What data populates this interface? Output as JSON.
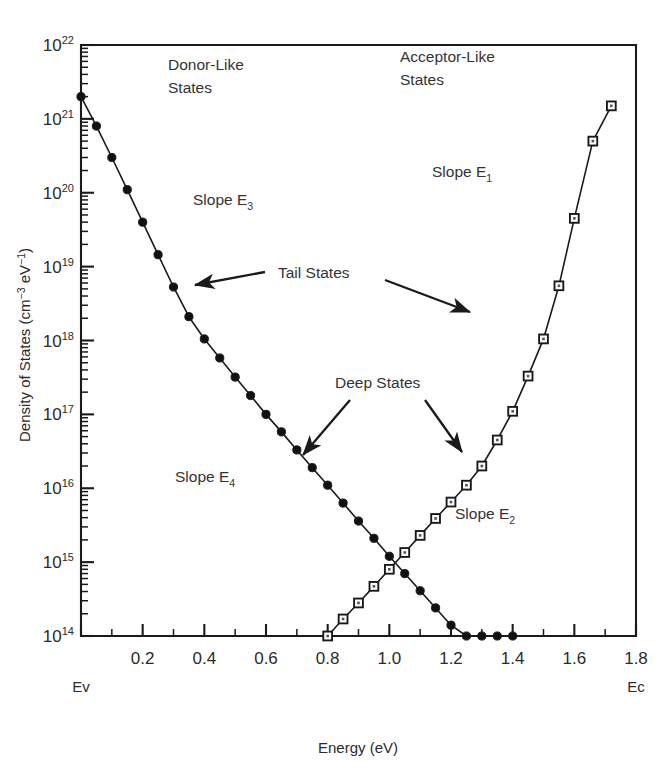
{
  "chart_data": {
    "type": "line",
    "title": "",
    "xlabel": "Energy (eV)",
    "ylabel": "Density of States (cm−3 eV−1)",
    "ylabel_parts": {
      "main": "Density of States (cm",
      "exp1": "−3",
      "mid": " eV",
      "exp2": "−1",
      "close": ")"
    },
    "xlim": [
      0.0,
      1.8
    ],
    "ylim": [
      100000000000000.0,
      1e+22
    ],
    "yscale": "log",
    "grid": false,
    "legend": "none",
    "xticks": [
      0.0,
      0.2,
      0.4,
      0.6,
      0.8,
      1.0,
      1.2,
      1.4,
      1.6,
      1.8
    ],
    "xtick_labels": [
      "",
      "0.2",
      "0.4",
      "0.6",
      "0.8",
      "1.0",
      "1.2",
      "1.4",
      "1.6",
      "1.8"
    ],
    "xminor_step": 0.1,
    "ytick_exponents": [
      14,
      15,
      16,
      17,
      18,
      19,
      20,
      21,
      22
    ],
    "ytick_labels": [
      "10^14",
      "10^15",
      "10^16",
      "10^17",
      "10^18",
      "10^19",
      "10^20",
      "10^21",
      "10^22"
    ],
    "ybase": "10",
    "axis_end_labels": {
      "left": "Ev",
      "right": "Ec"
    },
    "series": [
      {
        "name": "Donor-Like States",
        "marker": "filled-circle",
        "x": [
          0.0,
          0.05,
          0.1,
          0.15,
          0.2,
          0.25,
          0.3,
          0.35,
          0.4,
          0.45,
          0.5,
          0.55,
          0.6,
          0.65,
          0.7,
          0.75,
          0.8,
          0.85,
          0.9,
          0.95,
          1.0,
          1.05,
          1.1,
          1.15,
          1.2,
          1.25,
          1.3,
          1.35,
          1.4
        ],
        "y": [
          2e+21,
          8e+20,
          3e+20,
          1.1e+20,
          4e+19,
          1.45e+19,
          5.3e+18,
          2.1e+18,
          1.05e+18,
          5.8e+17,
          3.2e+17,
          1.8e+17,
          1e+17,
          5.8e+16,
          3.3e+16,
          1.9e+16,
          1.1e+16,
          6300000000000000.0,
          3600000000000000.0,
          2100000000000000.0,
          1200000000000000.0,
          700000000000000.0,
          410000000000000.0,
          240000000000000.0,
          140000000000000.0,
          100000000000000.0,
          100000000000000.0,
          100000000000000.0,
          100000000000000.0
        ],
        "y_actual_note": "log-linear decay: tail slope E3 then deep slope E4"
      },
      {
        "name": "Acceptor-Like States",
        "marker": "open-square",
        "x": [
          0.8,
          0.85,
          0.9,
          0.95,
          1.0,
          1.05,
          1.1,
          1.15,
          1.2,
          1.25,
          1.3,
          1.35,
          1.4,
          1.45,
          1.5,
          1.55,
          1.6,
          1.66,
          1.72
        ],
        "y": [
          100000000000000.0,
          170000000000000.0,
          280000000000000.0,
          470000000000000.0,
          800000000000000.0,
          1350000000000000.0,
          2300000000000000.0,
          3900000000000000.0,
          6500000000000000.0,
          1.1e+16,
          2e+16,
          4.5e+16,
          1.1e+17,
          3.3e+17,
          1.05e+18,
          5.5e+18,
          4.5e+19,
          5e+20,
          1.5e+21
        ],
        "y_actual_note": "deep slope E2 rising to tail slope E1"
      }
    ],
    "annotations": [
      {
        "id": "donor-like",
        "lines": [
          "Donor-Like",
          "States"
        ],
        "x_px": 168,
        "y_px": 70
      },
      {
        "id": "acceptor-like",
        "lines": [
          "Acceptor-Like",
          "States"
        ],
        "x_px": 400,
        "y_px": 62
      },
      {
        "id": "slope-e3",
        "text": "Slope E",
        "sub": "3",
        "x_px": 193,
        "y_px": 205
      },
      {
        "id": "slope-e1",
        "text": "Slope E",
        "sub": "1",
        "x_px": 432,
        "y_px": 177
      },
      {
        "id": "slope-e4",
        "text": "Slope E",
        "sub": "4",
        "x_px": 175,
        "y_px": 482
      },
      {
        "id": "slope-e2",
        "text": "Slope E",
        "sub": "2",
        "x_px": 455,
        "y_px": 519
      },
      {
        "id": "tail-states",
        "text": "Tail States",
        "x_px": 278,
        "y_px": 278
      },
      {
        "id": "deep-states",
        "text": "Deep States",
        "x_px": 335,
        "y_px": 388
      }
    ],
    "arrows": [
      {
        "id": "tail-left-arrow",
        "x1_px": 265,
        "y1_px": 272,
        "x2_px": 195,
        "y2_px": 285
      },
      {
        "id": "tail-right-arrow",
        "x1_px": 385,
        "y1_px": 280,
        "x2_px": 470,
        "y2_px": 312
      },
      {
        "id": "deep-left-arrow",
        "x1_px": 350,
        "y1_px": 400,
        "x2_px": 303,
        "y2_px": 455
      },
      {
        "id": "deep-right-arrow",
        "x1_px": 425,
        "y1_px": 400,
        "x2_px": 462,
        "y2_px": 452
      }
    ],
    "colors": {
      "ink": "#1a1a1a",
      "text": "#2b2b2b",
      "marker_fill": "#111111",
      "marker_open": "#ffffff",
      "background": "#ffffff"
    }
  }
}
